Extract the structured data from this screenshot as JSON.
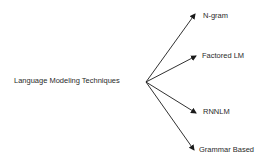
{
  "diagram": {
    "type": "tree",
    "root": {
      "label": "Language Modeling Techniques"
    },
    "children": [
      {
        "label": "N-gram"
      },
      {
        "label": "Factored LM"
      },
      {
        "label": "RNNLM"
      },
      {
        "label": "Grammar Based"
      }
    ],
    "colors": {
      "text": "#2a2a2a",
      "arrow": "#1a1a1a",
      "background": "#ffffff"
    }
  }
}
